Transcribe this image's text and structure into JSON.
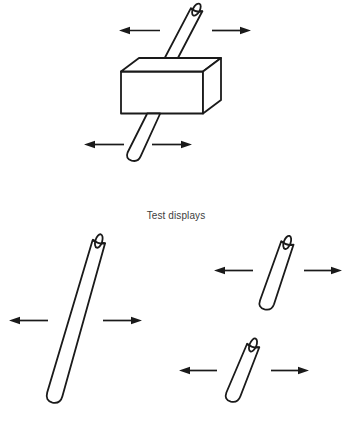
{
  "figure": {
    "caption": "Test displays",
    "background_color": "#ffffff",
    "line_color": "#1a1a1a",
    "fill_color": "#ffffff",
    "text_color": "#3d3d3d",
    "width": 352,
    "height": 425
  },
  "panels": [
    {
      "id": "occlusion-display",
      "name": "rod-and-box-occlusion-display",
      "description": "A tilted rod passing behind a rectangular box, with horizontal motion arrows above and below",
      "elements": [
        {
          "name": "rod-upper-segment",
          "kind": "rod",
          "state": "visible"
        },
        {
          "name": "occluder-box",
          "kind": "box",
          "state": "opaque"
        },
        {
          "name": "rod-lower-segment",
          "kind": "rod",
          "state": "visible"
        }
      ],
      "arrows": [
        {
          "name": "arrow-top-left",
          "direction": "left"
        },
        {
          "name": "arrow-top-right",
          "direction": "right"
        },
        {
          "name": "arrow-bottom-left",
          "direction": "left"
        },
        {
          "name": "arrow-bottom-right",
          "direction": "right"
        }
      ]
    },
    {
      "id": "test-displays",
      "name": "test-displays-panel",
      "label": "Test displays",
      "items": [
        {
          "name": "test-rod-complete",
          "kind": "rod",
          "description": "single long continuous rod",
          "arrows": [
            {
              "name": "arrow-left",
              "direction": "left"
            },
            {
              "name": "arrow-right",
              "direction": "right"
            }
          ]
        },
        {
          "name": "test-rod-segment-upper",
          "kind": "rod",
          "description": "short upper rod segment",
          "arrows": [
            {
              "name": "arrow-left",
              "direction": "left"
            },
            {
              "name": "arrow-right",
              "direction": "right"
            }
          ]
        },
        {
          "name": "test-rod-segment-lower",
          "kind": "rod",
          "description": "short lower rod segment",
          "arrows": [
            {
              "name": "arrow-left",
              "direction": "left"
            },
            {
              "name": "arrow-right",
              "direction": "right"
            }
          ]
        }
      ]
    }
  ]
}
